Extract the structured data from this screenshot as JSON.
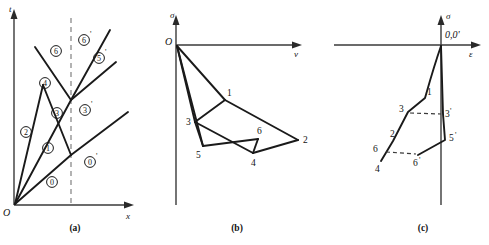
{
  "figure": {
    "panels": [
      {
        "id": "a",
        "caption": "(a)",
        "axis_x_label": "x",
        "axis_y_label": "t",
        "origin_label": "O",
        "description": "x-t wave interaction diagram with characteristic lines and numbered regions",
        "regions": [
          {
            "label": "0",
            "prime": "",
            "x": 52,
            "y": 182
          },
          {
            "label": "0",
            "prime": "'",
            "x": 90,
            "y": 162
          },
          {
            "label": "1",
            "prime": "",
            "x": 48,
            "y": 148
          },
          {
            "label": "2",
            "prime": "",
            "x": 26,
            "y": 132
          },
          {
            "label": "3",
            "prime": "",
            "x": 57,
            "y": 113
          },
          {
            "label": "3",
            "prime": "'",
            "x": 85,
            "y": 110
          },
          {
            "label": "4",
            "prime": "",
            "x": 45,
            "y": 83
          },
          {
            "label": "6",
            "prime": "",
            "x": 56,
            "y": 51
          },
          {
            "label": "6",
            "prime": "'",
            "x": 84,
            "y": 40
          },
          {
            "label": "5",
            "prime": "'",
            "x": 99,
            "y": 58
          }
        ]
      },
      {
        "id": "b",
        "caption": "(b)",
        "axis_x_label": "v",
        "axis_y_label": "σ",
        "origin_label": "O",
        "description": "sigma-v polar diagram with shock polars from origin",
        "points": [
          {
            "label": "1",
            "x": 225,
            "y": 100
          },
          {
            "label": "2",
            "x": 298,
            "y": 140
          },
          {
            "label": "3",
            "x": 195,
            "y": 122
          },
          {
            "label": "4",
            "x": 253,
            "y": 153
          },
          {
            "label": "5",
            "x": 203,
            "y": 146
          },
          {
            "label": "6",
            "x": 258,
            "y": 139
          }
        ]
      },
      {
        "id": "c",
        "caption": "(c)",
        "axis_x_label": "ε",
        "axis_y_label": "σ",
        "origin_label": "0,0'",
        "description": "sigma-epsilon loading paths with primed and unprimed states",
        "points": [
          {
            "label": "1",
            "x": 425,
            "y": 98
          },
          {
            "label": "2",
            "x": 393,
            "y": 141
          },
          {
            "label": "3",
            "x": 408,
            "y": 112
          },
          {
            "label": "3",
            "prime": "'",
            "x": 443,
            "y": 114
          },
          {
            "label": "4",
            "x": 381,
            "y": 161
          },
          {
            "label": "5",
            "prime": "'",
            "x": 445,
            "y": 140
          },
          {
            "label": "6",
            "x": 380,
            "y": 147
          },
          {
            "label": "6",
            "prime": "'",
            "x": 418,
            "y": 155
          }
        ]
      }
    ]
  }
}
